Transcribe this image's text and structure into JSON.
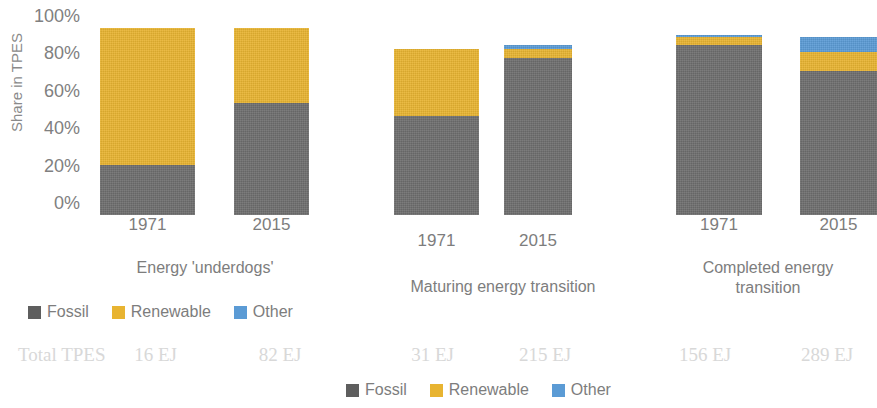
{
  "chart_data": {
    "type": "bar",
    "subtype": "stacked-100-percent-grouped",
    "title": "",
    "xlabel": "",
    "ylabel": "Share in TPES",
    "ylim": [
      0,
      100
    ],
    "yticks": [
      "0%",
      "20%",
      "40%",
      "60%",
      "80%",
      "100%"
    ],
    "grid": false,
    "legend_position": "bottom",
    "series": [
      {
        "name": "Fossil",
        "color": "#6e6e6e",
        "values": [
          27,
          60,
          53,
          84,
          91,
          77
        ]
      },
      {
        "name": "Renewable",
        "color": "#e8b431",
        "values": [
          73,
          40,
          36,
          5,
          4,
          10
        ]
      },
      {
        "name": "Other",
        "color": "#5b9bd5",
        "values": [
          0,
          0,
          0,
          2,
          1,
          8
        ]
      }
    ],
    "categories": [
      "1971",
      "2015",
      "1971",
      "2015",
      "1971",
      "2015"
    ],
    "group_totals_percent": [
      100,
      100,
      89,
      91,
      96,
      95
    ],
    "groups": [
      {
        "label": "Energy 'underdogs'",
        "categories": [
          "1971",
          "2015"
        ]
      },
      {
        "label": "Maturing energy transition",
        "categories": [
          "1971",
          "2015"
        ]
      },
      {
        "label": "Completed energy transition",
        "categories": [
          "1971",
          "2015"
        ]
      }
    ],
    "annotations": {
      "totals_row_label": "Total TPES",
      "totals": [
        "16 EJ",
        "82 EJ",
        "31 EJ",
        "215 EJ",
        "156 EJ",
        "289 EJ"
      ]
    }
  },
  "axis": {
    "y_title": "Share in TPES",
    "ticks": [
      {
        "label": "100%",
        "value": 100
      },
      {
        "label": "80%",
        "value": 80
      },
      {
        "label": "60%",
        "value": 60
      },
      {
        "label": "40%",
        "value": 40
      },
      {
        "label": "20%",
        "value": 20
      },
      {
        "label": "0%",
        "value": 0
      }
    ]
  },
  "bars": [
    {
      "category": "1971",
      "fossil": 27,
      "renewable": 73,
      "other": 0,
      "total": 100,
      "total_tpes": "16 EJ"
    },
    {
      "category": "2015",
      "fossil": 60,
      "renewable": 40,
      "other": 0,
      "total": 100,
      "total_tpes": "82 EJ"
    },
    {
      "category": "1971",
      "fossil": 53,
      "renewable": 36,
      "other": 0,
      "total": 89,
      "total_tpes": "31 EJ"
    },
    {
      "category": "2015",
      "fossil": 84,
      "renewable": 5,
      "other": 2,
      "total": 91,
      "total_tpes": "215 EJ"
    },
    {
      "category": "1971",
      "fossil": 91,
      "renewable": 4,
      "other": 1,
      "total": 96,
      "total_tpes": "156 EJ"
    },
    {
      "category": "2015",
      "fossil": 77,
      "renewable": 10,
      "other": 8,
      "total": 95,
      "total_tpes": "289 EJ"
    }
  ],
  "groups": [
    {
      "label": "Energy 'underdogs'"
    },
    {
      "label": "Maturing energy transition"
    },
    {
      "label": "Completed energy transition"
    }
  ],
  "legend_top": {
    "items": [
      {
        "label": "Fossil",
        "color": "#5e5e5e",
        "icon": "square-swatch-icon"
      },
      {
        "label": "Renewable",
        "color": "#e8b431",
        "icon": "square-swatch-icon"
      },
      {
        "label": "Other",
        "color": "#5b9bd5",
        "icon": "square-swatch-icon"
      }
    ]
  },
  "legend_bottom": {
    "items": [
      {
        "label": "Fossil",
        "color": "#5e5e5e",
        "icon": "square-swatch-icon"
      },
      {
        "label": "Renewable",
        "color": "#e8b431",
        "icon": "square-swatch-icon"
      },
      {
        "label": "Other",
        "color": "#5b9bd5",
        "icon": "square-swatch-icon"
      }
    ]
  },
  "totals_row": {
    "label": "Total TPES",
    "values": [
      "16 EJ",
      "82 EJ",
      "31 EJ",
      "215 EJ",
      "156 EJ",
      "289 EJ"
    ]
  }
}
